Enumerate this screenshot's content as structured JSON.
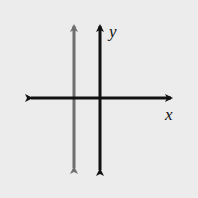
{
  "diagram": {
    "type": "coordinate-plane",
    "axes": {
      "x_label": "x",
      "y_label": "y",
      "color": "#111111"
    },
    "lines": [
      {
        "name": "vertical line left of y-axis",
        "orientation": "vertical",
        "position": "negative x",
        "color": "#6f6f6f"
      }
    ],
    "background": "#ececec"
  }
}
